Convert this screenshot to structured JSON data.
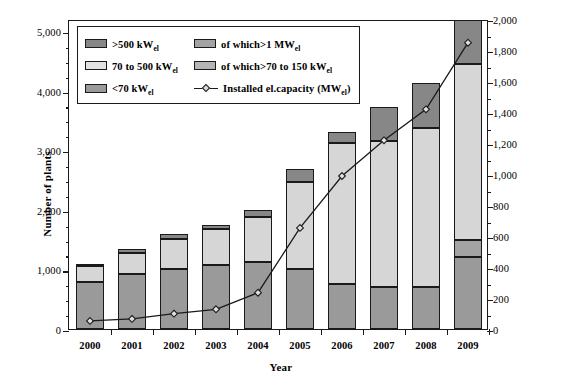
{
  "chart_data": {
    "type": "bar",
    "title": "",
    "xlabel": "Year",
    "ylabel": "Number of plants",
    "y2label": "Installed electrical capacity (MW_el)",
    "categories": [
      "2000",
      "2001",
      "2002",
      "2003",
      "2004",
      "2005",
      "2006",
      "2007",
      "2008",
      "2009"
    ],
    "ylim": [
      0,
      5200
    ],
    "y2lim": [
      0,
      2000
    ],
    "yticks": [
      0,
      1000,
      2000,
      3000,
      4000,
      5000
    ],
    "ytick_labels": [
      "0",
      "1,000",
      "2,000",
      "3,000",
      "4,000",
      "5,000"
    ],
    "y2ticks": [
      0,
      200,
      400,
      600,
      800,
      1000,
      1200,
      1400,
      1600,
      1800,
      2000
    ],
    "y2tick_labels": [
      "0",
      "200",
      "400",
      "600",
      "800",
      "1,000",
      "1,200",
      "1,400",
      "1,600",
      "1,800",
      "2,000"
    ],
    "grid": false,
    "legend_position": "upper-left-inside",
    "stacked": true,
    "series": [
      {
        "name": "<70 kW_el",
        "key": "below70",
        "color": "#9a9a9a",
        "values": [
          790,
          920,
          1010,
          1070,
          1120,
          1010,
          760,
          700,
          700,
          1200
        ]
      },
      {
        "name": "70 to 500 kW_el",
        "key": "mid",
        "color": "#d6d6d6",
        "values": [
          260,
          350,
          500,
          600,
          760,
          1450,
          2360,
          2450,
          2680,
          2950
        ]
      },
      {
        "name": ">500 kW_el",
        "key": "above500",
        "color": "#878787",
        "values": [
          30,
          80,
          80,
          80,
          110,
          220,
          190,
          580,
          740,
          840
        ]
      },
      {
        "name": "of which>70 to 150 kW_el",
        "key": "of_which_70_150",
        "color": "#a3a3a3",
        "values": [
          0,
          0,
          0,
          0,
          0,
          0,
          0,
          0,
          0,
          300
        ]
      },
      {
        "name": "of which>1 MW_el",
        "key": "of_which_1mw",
        "color": "#a3a3a3",
        "values": [
          0,
          0,
          0,
          0,
          0,
          0,
          0,
          0,
          0,
          260
        ]
      }
    ],
    "totals": [
      1080,
      1350,
      1590,
      1750,
      1990,
      2680,
      3310,
      3730,
      4120,
      4990
    ],
    "line": {
      "name": "Installed el.capacity (MW_el)",
      "axis": "right",
      "marker": "diamond",
      "color": "#1a1a1a",
      "values": [
        65,
        78,
        112,
        140,
        247,
        665,
        1000,
        1230,
        1430,
        1860
      ]
    }
  },
  "axes": {
    "left": {
      "title_main": "Number of plants",
      "ticks": [
        "5,000",
        "4,000",
        "3,000",
        "2,000",
        "1,000",
        "0"
      ]
    },
    "right": {
      "title_main": "Installed electrical capacity",
      "title_unit_open": "(MW",
      "title_unit_sub": "el",
      "title_unit_close": ")",
      "ticks": [
        "2,000",
        "1,800",
        "1,600",
        "1,400",
        "1,200",
        "1,000",
        "800",
        "600",
        "400",
        "200",
        "0"
      ]
    },
    "bottom": {
      "title": "Year",
      "ticks": [
        "2000",
        "2001",
        "2002",
        "2003",
        "2004",
        "2005",
        "2006",
        "2007",
        "2008",
        "2009"
      ]
    }
  },
  "legend": {
    "items": [
      {
        "id": "above500",
        "label_main": ">500 kW",
        "label_sub": "el",
        "swatch": "dark-gray-swatch",
        "color": "#878787"
      },
      {
        "id": "of_which_1mw",
        "label_main": "of which>1 MW",
        "label_sub": "el",
        "swatch": "medium-gray-swatch",
        "color": "#a3a3a3"
      },
      {
        "id": "mid",
        "label_main": "70 to 500 kW",
        "label_sub": "el",
        "swatch": "light-gray-swatch",
        "color": "#e3e3e3"
      },
      {
        "id": "of_which_70_150",
        "label_main": "of which>70 to 150 kW",
        "label_sub": "el",
        "swatch": "medium-light-gray-swatch",
        "color": "#b5b5b5"
      },
      {
        "id": "below70",
        "label_main": "<70 kW",
        "label_sub": "el",
        "swatch": "medium-gray-swatch",
        "color": "#9a9a9a"
      },
      {
        "id": "line",
        "label_main": "Installed el.capacity",
        "label_unit_open": "(MW",
        "label_sub": "el",
        "label_unit_close": ")",
        "swatch": "line-diamond-marker",
        "color": "#1a1a1a"
      }
    ]
  }
}
